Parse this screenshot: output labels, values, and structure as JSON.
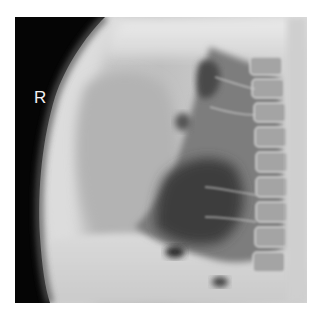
{
  "image": {
    "kind": "lateral chest radiograph",
    "side_marker": "R"
  }
}
